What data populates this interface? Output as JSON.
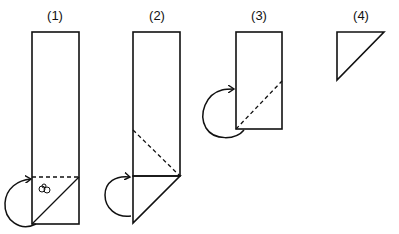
{
  "diagram": {
    "type": "folding-steps",
    "stroke_color": "#111111",
    "background": "#ffffff",
    "steps": [
      {
        "label": "(1)",
        "shape": "tall-rectangle",
        "fold_line": "horizontal-dashed",
        "has_diagonal": true,
        "arrow": "fold-back",
        "mark": "small scribble"
      },
      {
        "label": "(2)",
        "shape": "rectangle-with-triangle-below",
        "fold_line": "diagonal-dashed",
        "arrow": "fold-back"
      },
      {
        "label": "(3)",
        "shape": "short-rectangle",
        "fold_line": "diagonal-dashed",
        "arrow": "fold-back"
      },
      {
        "label": "(4)",
        "shape": "right-triangle"
      }
    ]
  }
}
